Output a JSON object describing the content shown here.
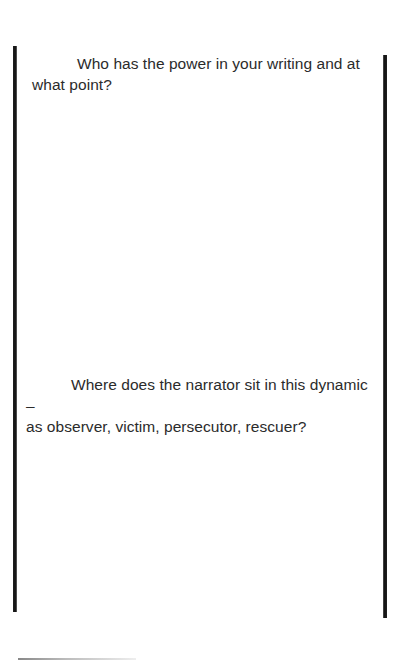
{
  "document": {
    "prompts": [
      {
        "line1": "Who has the power in your writing and at",
        "line2": "what point?"
      },
      {
        "line1": "Where does the narrator sit in this dynamic –",
        "line2": "as observer, victim, persecutor, rescuer?"
      }
    ]
  },
  "colors": {
    "text": "#2b2b2b",
    "rule": "#111111",
    "background": "#ffffff"
  }
}
